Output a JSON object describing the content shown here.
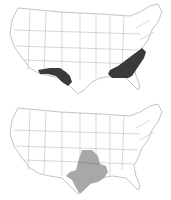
{
  "maps": [
    {
      "id": "top",
      "description": "US map with dark-shaded regions: southwest Texas/New Mexico band and southeastern Atlantic states",
      "highlight_color": "#3a3a3a",
      "regions": [
        "southwest-border-band",
        "southeast-atlantic-states"
      ]
    },
    {
      "id": "bottom",
      "description": "US map with gray-shaded region: Texas and Oklahoma",
      "highlight_color": "#a8a8a8",
      "regions": [
        "texas-oklahoma"
      ]
    }
  ],
  "colors": {
    "background": "#ffffff",
    "state_fill": "#ffffff",
    "state_border": "#9a9a9a",
    "dark_highlight": "#3a3a3a",
    "gray_highlight": "#a8a8a8"
  }
}
